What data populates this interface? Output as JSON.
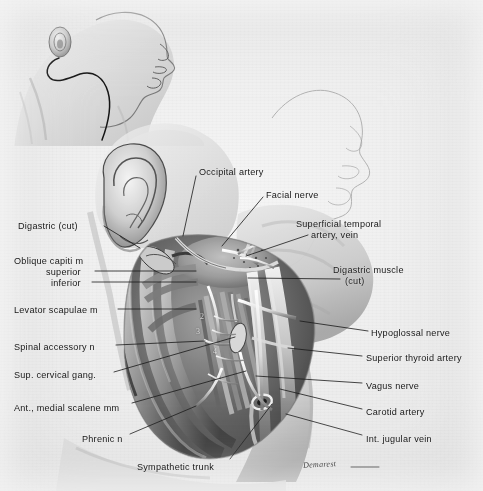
{
  "plate": {
    "title": "Dissection of the upper neck — posterior auricular and carotid region",
    "medium": "halftone wash drawing on paper",
    "signature": "Demarest",
    "bg_color": "#e9e8e4",
    "ink_color": "#17191c"
  },
  "inset": {
    "name": "head-in-profile-incision-inset",
    "description": "Lateral head and neck in profile showing the skin incision line from behind the ear running down the neck",
    "incision_label": ""
  },
  "labels_left": [
    {
      "id": "digastric-cut",
      "text": "Digastric (cut)",
      "x": 18,
      "y": 221,
      "leader": [
        [
          104,
          226
        ],
        [
          140,
          248
        ]
      ]
    },
    {
      "id": "oblique-capiti-m",
      "text": "Oblique capiti m",
      "x": 14,
      "y": 256,
      "leader": []
    },
    {
      "id": "oblique-capiti-superior",
      "text": "superior",
      "x": 46,
      "y": 267,
      "leader": [
        [
          95,
          271
        ],
        [
          196,
          271
        ]
      ]
    },
    {
      "id": "oblique-capiti-inferior",
      "text": "inferior",
      "x": 51,
      "y": 278,
      "leader": [
        [
          92,
          282
        ],
        [
          196,
          282
        ]
      ]
    },
    {
      "id": "levator-scapulae-m",
      "text": "Levator scapulae m",
      "x": 14,
      "y": 305,
      "leader": [
        [
          118,
          309
        ],
        [
          196,
          309
        ]
      ]
    },
    {
      "id": "spinal-accessory-n",
      "text": "Spinal accessory n",
      "x": 14,
      "y": 342,
      "leader": [
        [
          116,
          345
        ],
        [
          205,
          341
        ]
      ]
    },
    {
      "id": "sup-cervical-gang",
      "text": "Sup. cervical gang.",
      "x": 14,
      "y": 370,
      "leader": [
        [
          114,
          372
        ],
        [
          235,
          337
        ]
      ]
    },
    {
      "id": "ant-medial-scalene-mm",
      "text": "Ant., medial scalene mm",
      "x": 14,
      "y": 403,
      "leader": [
        [
          132,
          403
        ],
        [
          246,
          371
        ]
      ]
    },
    {
      "id": "phrenic-n",
      "text": "Phrenic n",
      "x": 82,
      "y": 434,
      "leader": [
        [
          130,
          434
        ],
        [
          196,
          406
        ]
      ]
    },
    {
      "id": "sympathetic-trunk",
      "text": "Sympathetic trunk",
      "x": 137,
      "y": 462,
      "leader": [
        [
          230,
          459
        ],
        [
          272,
          404
        ]
      ]
    }
  ],
  "labels_right": [
    {
      "id": "occipital-artery",
      "text": "Occipital artery",
      "x": 199,
      "y": 167,
      "leader": [
        [
          196,
          176
        ],
        [
          183,
          236
        ]
      ]
    },
    {
      "id": "facial-nerve",
      "text": "Facial nerve",
      "x": 266,
      "y": 190,
      "leader": [
        [
          263,
          197
        ],
        [
          222,
          246
        ]
      ]
    },
    {
      "id": "superficial-temporal",
      "text": "Superficial temporal",
      "x": 296,
      "y": 219,
      "leader": []
    },
    {
      "id": "superficial-temporal-2",
      "text": "artery, vein",
      "x": 311,
      "y": 230,
      "leader": [
        [
          308,
          235
        ],
        [
          246,
          256
        ]
      ]
    },
    {
      "id": "digastric-muscle",
      "text": "Digastric muscle",
      "x": 333,
      "y": 265,
      "leader": []
    },
    {
      "id": "digastric-muscle-2",
      "text": "(cut)",
      "x": 345,
      "y": 276,
      "leader": [
        [
          340,
          279
        ],
        [
          248,
          278
        ]
      ]
    },
    {
      "id": "hypoglossal-nerve",
      "text": "Hypoglossal nerve",
      "x": 371,
      "y": 328,
      "leader": [
        [
          368,
          331
        ],
        [
          300,
          321
        ]
      ]
    },
    {
      "id": "superior-thyroid-artery",
      "text": "Superior thyroid artery",
      "x": 366,
      "y": 353,
      "leader": [
        [
          362,
          356
        ],
        [
          288,
          348
        ]
      ]
    },
    {
      "id": "vagus-nerve",
      "text": "Vagus nerve",
      "x": 366,
      "y": 381,
      "leader": [
        [
          362,
          383
        ],
        [
          256,
          376
        ]
      ]
    },
    {
      "id": "carotid-artery",
      "text": "Carotid artery",
      "x": 366,
      "y": 407,
      "leader": [
        [
          362,
          409
        ],
        [
          280,
          389
        ]
      ]
    },
    {
      "id": "int-jugular-vein",
      "text": "Int. jugular vein",
      "x": 366,
      "y": 434,
      "leader": [
        [
          362,
          435
        ],
        [
          286,
          414
        ]
      ]
    }
  ],
  "field_numbers": [
    {
      "id": "field-number-2",
      "text": "2",
      "x": 200,
      "y": 312
    },
    {
      "id": "field-number-3",
      "text": "3",
      "x": 196,
      "y": 327
    },
    {
      "id": "field-number-4",
      "text": "4",
      "x": 213,
      "y": 347
    }
  ],
  "signature": {
    "text": "Demarest",
    "x": 303,
    "y": 460
  }
}
